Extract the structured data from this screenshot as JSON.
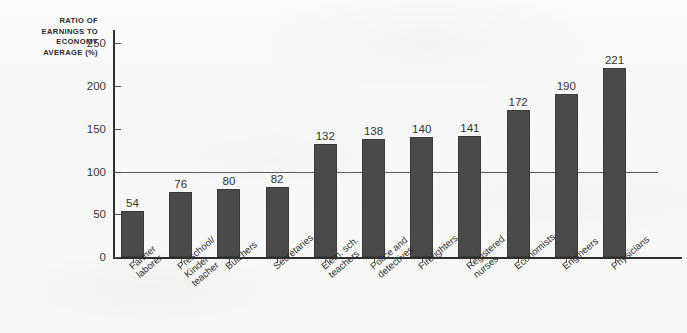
{
  "chart_data": {
    "type": "bar",
    "title": "",
    "ylabel": "RATIO OF\nEARNINGS TO\nECONOMY\nAVERAGE (%)",
    "xlabel": "",
    "ylim": [
      0,
      265
    ],
    "yticks": [
      0,
      50,
      100,
      150,
      200,
      250
    ],
    "grid": false,
    "reference_line": 100,
    "bar_color": "#4a4a4a",
    "axis_color": "#2e2e2e",
    "categories": [
      "Farmer\nlaborer",
      "Preschool/\nKinder\nteacher",
      "Butchers",
      "Secretaries",
      "Elem. sch.\nteachers",
      "Police and\ndetectives",
      "Firefighters",
      "Registered\nnurses",
      "Economists",
      "Engineers",
      "Physicians"
    ],
    "values": [
      54,
      76,
      80,
      82,
      132,
      138,
      140,
      141,
      172,
      190,
      221
    ]
  }
}
